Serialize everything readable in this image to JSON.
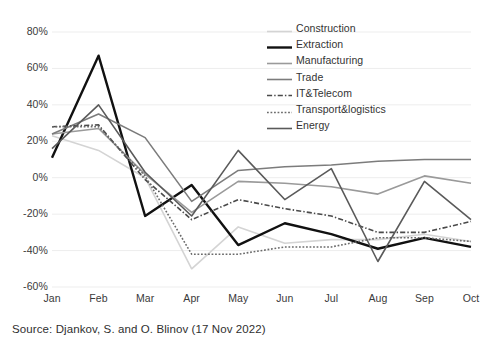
{
  "source_note": "Source: Djankov, S. and O. Blinov (17 Nov 2022)",
  "chart_data": {
    "type": "line",
    "title": "",
    "xlabel": "",
    "ylabel": "",
    "categories": [
      "Jan",
      "Feb",
      "Mar",
      "Apr",
      "May",
      "Jun",
      "Jul",
      "Aug",
      "Sep",
      "Oct"
    ],
    "ylim": [
      -60,
      80
    ],
    "ytick_values": [
      80,
      60,
      40,
      20,
      0,
      -20,
      -40,
      -60
    ],
    "ytick_labels": [
      "80%",
      "60%",
      "40%",
      "20%",
      "0%",
      "-20%",
      "-40%",
      "-60%"
    ],
    "grid": true,
    "value_suffix": "%",
    "legend_position": "top-right",
    "series": [
      {
        "name": "Construction",
        "color": "#d4d4d4",
        "style": "solid",
        "width": 1.6,
        "values": [
          23,
          15,
          0,
          -50,
          -27,
          -36,
          -34,
          -34,
          -31,
          -35
        ]
      },
      {
        "name": "Extraction",
        "color": "#111111",
        "style": "solid",
        "width": 2.4,
        "values": [
          11,
          67,
          -21,
          -4,
          -37,
          -25,
          -31,
          -39,
          -33,
          -38
        ]
      },
      {
        "name": "Manufacturing",
        "color": "#9a9a9a",
        "style": "solid",
        "width": 1.6,
        "values": [
          24,
          27,
          2,
          -19,
          -2,
          -3,
          -5,
          -9,
          1,
          -3
        ]
      },
      {
        "name": "Trade",
        "color": "#7c7c7c",
        "style": "solid",
        "width": 1.6,
        "values": [
          24,
          35,
          22,
          -13,
          4,
          6,
          7,
          9,
          10,
          10
        ]
      },
      {
        "name": "IT&Telecom",
        "color": "#4a4a4a",
        "style": "dashdot",
        "width": 1.6,
        "values": [
          28,
          29,
          -1,
          -23,
          -12,
          -17,
          -21,
          -30,
          -30,
          -24
        ]
      },
      {
        "name": "Transport&logistics",
        "color": "#6a6a6a",
        "style": "dotted",
        "width": 1.6,
        "values": [
          28,
          28,
          1,
          -42,
          -42,
          -38,
          -38,
          -33,
          -33,
          -35
        ]
      },
      {
        "name": "Energy",
        "color": "#5a5a5a",
        "style": "solid",
        "width": 1.6,
        "values": [
          16,
          40,
          3,
          -21,
          15,
          -12,
          5,
          -46,
          -2,
          -23
        ]
      }
    ]
  }
}
